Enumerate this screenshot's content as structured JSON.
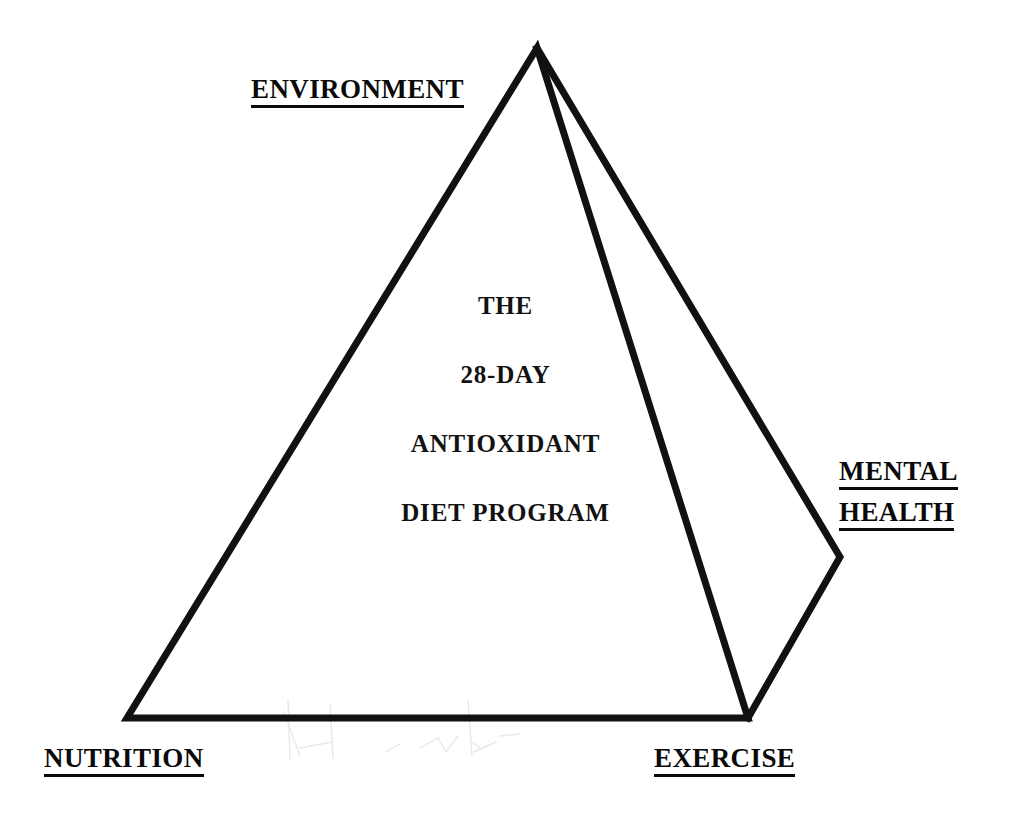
{
  "diagram": {
    "type": "pyramid-diagram",
    "title_lines": [
      "THE",
      "28-DAY",
      "ANTIOXIDANT",
      "DIET PROGRAM"
    ],
    "vertex_labels": {
      "apex": "ENVIRONMENT",
      "bottom_left": "NUTRITION",
      "bottom_right": "EXERCISE",
      "right": [
        "MENTAL",
        "HEALTH"
      ]
    },
    "colors": {
      "stroke": "#111111",
      "background": "#ffffff",
      "text": "#0a0a0a"
    },
    "geometry": {
      "apex": [
        537,
        48
      ],
      "bottom_left": [
        127,
        718
      ],
      "bottom_right": [
        748,
        718
      ],
      "right_vertex": [
        840,
        557
      ],
      "stroke_width": 7
    }
  }
}
